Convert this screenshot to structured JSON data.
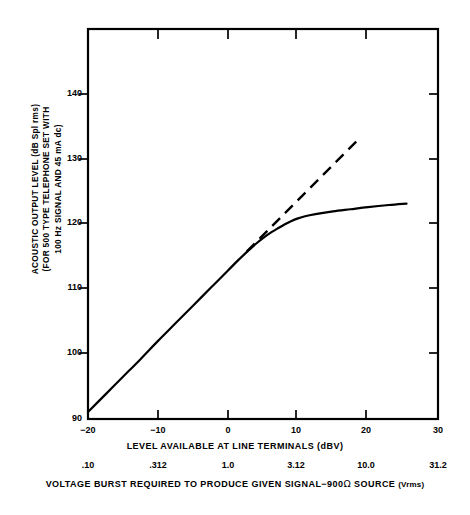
{
  "figure": {
    "background_color": "#ffffff",
    "line_color": "#000000"
  },
  "yaxis": {
    "title_lines": [
      "ACOUSTIC OUTPUT LEVEL (dB Spl rms)",
      "(FOR 500 TYPE TELEPHONE SET WITH",
      "100 Hz SIGNAL AND 45 mA dc)"
    ],
    "ticks": [
      "140",
      "130",
      "120",
      "110",
      "100",
      "90"
    ],
    "tick_values": [
      140,
      130,
      120,
      110,
      100,
      90
    ]
  },
  "xaxis": {
    "title": "LEVEL AVAILABLE AT LINE TERMINALS (dBV)",
    "ticks": [
      "−20",
      "−10",
      "0",
      "10",
      "20",
      "30"
    ],
    "tick_values": [
      -20,
      -10,
      0,
      10,
      20,
      30
    ]
  },
  "secondary_axis": {
    "ticks": [
      ".10",
      ".312",
      "1.0",
      "3.12",
      "10.0",
      "31.2"
    ],
    "tick_values": [
      0.1,
      0.312,
      1.0,
      3.12,
      10.0,
      31.2
    ],
    "caption_part1": "VOLTAGE BURST REQUIRED TO PRODUCE GIVEN SIGNAL−900",
    "caption_omega": "Ω",
    "caption_part2": " SOURCE ",
    "caption_units": "(Vrms)"
  },
  "chart_data": {
    "type": "line",
    "title": "",
    "xlabel": "LEVEL AVAILABLE AT LINE TERMINALS (dBV)",
    "ylabel": "ACOUSTIC OUTPUT LEVEL (dB Spl rms) (FOR 500 TYPE TELEPHONE SET WITH 100 Hz SIGNAL AND 45 mA dc)",
    "x2label": "VOLTAGE BURST REQUIRED TO PRODUCE GIVEN SIGNAL−900Ω SOURCE (Vrms)",
    "xlim": [
      -20,
      30
    ],
    "ylim": [
      90,
      145.4
    ],
    "xticks": [
      -20,
      -10,
      0,
      10,
      20,
      30
    ],
    "yticks": [
      90,
      100,
      110,
      120,
      130,
      140
    ],
    "x2ticks": [
      0.1,
      0.312,
      1.0,
      3.12,
      10.0,
      31.2
    ],
    "grid": false,
    "legend": "none",
    "series": [
      {
        "name": "measured-acoustic-output",
        "style": "solid",
        "linewidth": 2.2,
        "points": [
          [
            -20.0,
            91.0
          ],
          [
            -17.5,
            93.5
          ],
          [
            -15.0,
            96.0
          ],
          [
            -12.5,
            98.5
          ],
          [
            -10.0,
            101.1
          ],
          [
            -7.5,
            103.6
          ],
          [
            -5.0,
            106.1
          ],
          [
            -2.5,
            108.6
          ],
          [
            0.0,
            111.1
          ],
          [
            1.5,
            112.6
          ],
          [
            3.0,
            114.0
          ],
          [
            4.0,
            114.9
          ],
          [
            5.0,
            115.7
          ],
          [
            6.0,
            116.4
          ],
          [
            7.0,
            117.0
          ],
          [
            8.0,
            117.6
          ],
          [
            9.0,
            118.1
          ],
          [
            10.0,
            118.5
          ],
          [
            11.0,
            118.8
          ],
          [
            12.5,
            119.1
          ],
          [
            15.0,
            119.5
          ],
          [
            17.5,
            119.8
          ],
          [
            20.0,
            120.1
          ],
          [
            23.0,
            120.4
          ],
          [
            25.5,
            120.6
          ]
        ]
      },
      {
        "name": "ideal-linear-extension",
        "style": "dashed",
        "linewidth": 2.4,
        "dash_pattern": "11 7",
        "points": [
          [
            2.7,
            113.8
          ],
          [
            18.5,
            129.6
          ]
        ]
      }
    ]
  }
}
